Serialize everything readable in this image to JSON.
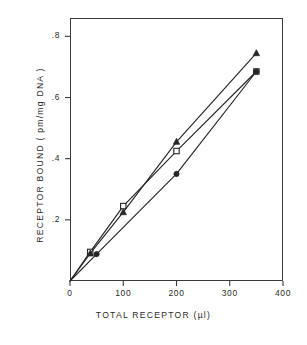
{
  "chart_data": {
    "type": "line",
    "title": "",
    "xlabel": "TOTAL RECEPTOR (µl)",
    "ylabel": "RECEPTOR BOUND ( pm/mg DNA )",
    "xlim": [
      0,
      400
    ],
    "ylim": [
      0,
      0.86
    ],
    "xticks": [
      0,
      100,
      200,
      300,
      400
    ],
    "xtick_labels": [
      "0",
      "100",
      "200",
      "300",
      "400"
    ],
    "yticks": [
      0.2,
      0.4,
      0.6,
      0.8
    ],
    "ytick_labels": [
      ".2",
      ".4",
      ".6",
      ".8"
    ],
    "grid": false,
    "legend": "none",
    "series": [
      {
        "name": "open-square",
        "marker": "open-square",
        "x": [
          0,
          38,
          100,
          200,
          350
        ],
        "y": [
          0.0,
          0.095,
          0.245,
          0.425,
          0.685
        ]
      },
      {
        "name": "filled-triangle",
        "marker": "filled-triangle",
        "x": [
          0,
          38,
          100,
          200,
          350
        ],
        "y": [
          0.0,
          0.09,
          0.225,
          0.455,
          0.745
        ]
      },
      {
        "name": "filled-circle",
        "marker": "filled-circle",
        "x": [
          0,
          50,
          200,
          350
        ],
        "y": [
          0.0,
          0.088,
          0.35,
          0.685
        ]
      }
    ]
  },
  "figure": {
    "caption_partial": ""
  },
  "style": {
    "line_color": "#262626",
    "frame_color": "#3a3a3a",
    "text_color": "#2b2b2b",
    "background": "#ffffff"
  }
}
